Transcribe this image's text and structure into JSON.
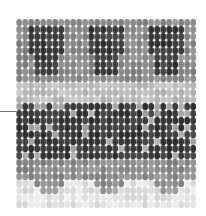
{
  "figure": {
    "leader_line": {
      "y": 111,
      "x_start": 0,
      "x_end": 16,
      "color": "#6a6a6a"
    },
    "grid": {
      "cols": 30,
      "rows": 27,
      "cell_w": 6,
      "cell_h": 7
    },
    "bands": [
      {
        "name": "top-motif-band",
        "rows": [
          0,
          8
        ],
        "base": "#8a8a8a",
        "motif": "#3c3c3c"
      },
      {
        "name": "light-band",
        "rows": [
          9,
          11
        ],
        "base": "#bdbdbd"
      },
      {
        "name": "dark-band",
        "rows": [
          12,
          19
        ],
        "base": "#3a3a3a",
        "speckle": "#a8a8a8"
      },
      {
        "name": "mid-band",
        "rows": [
          20,
          23
        ],
        "base": "#8c8c8c"
      },
      {
        "name": "fringe",
        "rows": [
          24,
          26
        ],
        "base": "#e2e2e2"
      }
    ]
  }
}
